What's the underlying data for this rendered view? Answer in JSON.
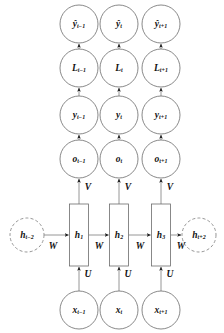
{
  "diagram": {
    "background_color": "#ffffff",
    "node_stroke_color": "#6b6b6b",
    "edge_color": "#8a8a8a",
    "text_color": "#111111",
    "rows": [
      {
        "row_name": "prediction-row",
        "shape": "circle",
        "nodes": [
          {
            "base": "ŷ",
            "sub": "t−1",
            "cx": 79,
            "cy": 24
          },
          {
            "base": "ŷ",
            "sub": "t",
            "cx": 119,
            "cy": 24
          },
          {
            "base": "ŷ",
            "sub": "t+1",
            "cx": 161,
            "cy": 24
          }
        ]
      },
      {
        "row_name": "loss-row",
        "shape": "circle",
        "nodes": [
          {
            "base": "L",
            "sub": "t−1",
            "cx": 79,
            "cy": 68
          },
          {
            "base": "L",
            "sub": "t",
            "cx": 119,
            "cy": 68
          },
          {
            "base": "L",
            "sub": "t+1",
            "cx": 161,
            "cy": 68
          }
        ]
      },
      {
        "row_name": "target-row",
        "shape": "circle",
        "nodes": [
          {
            "base": "y",
            "sub": "t−1",
            "cx": 79,
            "cy": 115
          },
          {
            "base": "y",
            "sub": "t",
            "cx": 119,
            "cy": 115
          },
          {
            "base": "y",
            "sub": "t+1",
            "cx": 161,
            "cy": 115
          }
        ]
      },
      {
        "row_name": "output-row",
        "shape": "circle",
        "nodes": [
          {
            "base": "o",
            "sub": "t−1",
            "cx": 79,
            "cy": 159
          },
          {
            "base": "o",
            "sub": "t",
            "cx": 119,
            "cy": 159
          },
          {
            "base": "o",
            "sub": "t+1",
            "cx": 161,
            "cy": 159
          }
        ]
      },
      {
        "row_name": "hidden-row",
        "shape": "rect",
        "nodes": [
          {
            "base": "h",
            "sub": "1",
            "cx": 79,
            "cy": 235
          },
          {
            "base": "h",
            "sub": "2",
            "cx": 119,
            "cy": 235
          },
          {
            "base": "h",
            "sub": "3",
            "cx": 161,
            "cy": 235
          }
        ]
      },
      {
        "row_name": "input-row",
        "shape": "circle",
        "nodes": [
          {
            "base": "x",
            "sub": "t−1",
            "cx": 79,
            "cy": 310
          },
          {
            "base": "x",
            "sub": "t",
            "cx": 119,
            "cy": 310
          },
          {
            "base": "x",
            "sub": "t+1",
            "cx": 161,
            "cy": 310
          }
        ]
      }
    ],
    "context_nodes": [
      {
        "node_name": "hidden-context-left",
        "base": "h",
        "sub": "t−2",
        "cx": 27,
        "cy": 235,
        "style": "dashed"
      },
      {
        "node_name": "hidden-context-right",
        "base": "h",
        "sub": "t+2",
        "cx": 199,
        "cy": 235,
        "style": "dashed"
      }
    ],
    "weights": {
      "input_to_hidden": {
        "symbol": "U",
        "positions": [
          {
            "x": 88,
            "y": 275
          },
          {
            "x": 128,
            "y": 275
          },
          {
            "x": 170,
            "y": 275
          }
        ]
      },
      "hidden_to_hidden": {
        "symbol": "W",
        "positions": [
          {
            "x": 53,
            "y": 247
          },
          {
            "x": 99,
            "y": 247
          },
          {
            "x": 140,
            "y": 247
          },
          {
            "x": 181,
            "y": 247
          }
        ]
      },
      "hidden_to_output": {
        "symbol": "V",
        "positions": [
          {
            "x": 88,
            "y": 188
          },
          {
            "x": 128,
            "y": 188
          },
          {
            "x": 170,
            "y": 188
          }
        ]
      }
    },
    "geometry": {
      "node_radius": 19,
      "context_radius": 17,
      "hidden_rect_width": 19,
      "hidden_rect_height": 62
    }
  }
}
